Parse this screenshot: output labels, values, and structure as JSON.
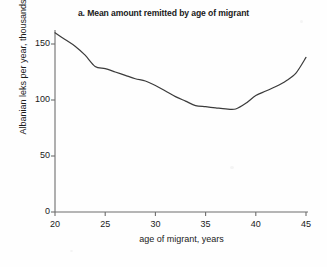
{
  "chart_data": {
    "type": "line",
    "title": "a. Mean amount remitted by age of migrant",
    "xlabel": "age of migrant, years",
    "ylabel": "Albanian leks per year, thousands",
    "xlim": [
      20,
      45
    ],
    "ylim": [
      0,
      160
    ],
    "grid": false,
    "legend": "none",
    "x_ticks": [
      "20",
      "25",
      "30",
      "35",
      "40",
      "45"
    ],
    "x_tick_values": [
      20,
      25,
      30,
      35,
      40,
      45
    ],
    "y_ticks": [
      "0",
      "50",
      "100",
      "150"
    ],
    "y_tick_values": [
      0,
      50,
      100,
      150
    ],
    "series": [
      {
        "name": "Mean amount remitted",
        "color": "#3b3b3b",
        "x": [
          20,
          21,
          22,
          23,
          24,
          25,
          26,
          27,
          28,
          29,
          30,
          31,
          32,
          33,
          34,
          35,
          36,
          37,
          38,
          39,
          40,
          41,
          42,
          43,
          44,
          45
        ],
        "values": [
          160,
          154,
          148,
          140,
          130,
          128,
          125,
          122,
          119,
          117,
          113,
          108,
          103,
          99,
          95,
          94,
          93,
          92,
          92,
          97,
          104,
          108,
          112,
          117,
          124,
          138
        ]
      }
    ]
  },
  "figure": {
    "panel_label": "a.",
    "background_color": "#fefefe",
    "axis_color": "#6d6d6d",
    "line_color": "#3b3b3b"
  }
}
